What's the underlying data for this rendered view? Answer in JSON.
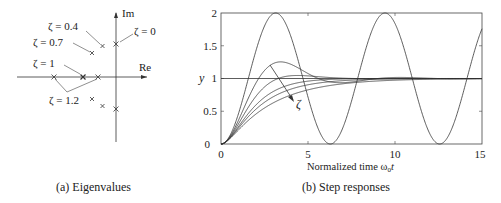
{
  "chart_data": [
    {
      "type": "scatter",
      "title": "Eigenvalues",
      "caption": "(a) Eigenvalues",
      "xlabel": "Re",
      "ylabel": "Im",
      "grid": false,
      "points": [
        {
          "zeta": 0,
          "re": 0.0,
          "im": 1.0
        },
        {
          "zeta": 0,
          "re": 0.0,
          "im": -1.0
        },
        {
          "zeta": 0.4,
          "re": -0.4,
          "im": 0.92
        },
        {
          "zeta": 0.4,
          "re": -0.4,
          "im": -0.92
        },
        {
          "zeta": 0.7,
          "re": -0.7,
          "im": 0.71
        },
        {
          "zeta": 0.7,
          "re": -0.7,
          "im": -0.71
        },
        {
          "zeta": 1,
          "re": -1.0,
          "im": 0.0
        },
        {
          "zeta": 1.2,
          "re": -1.86,
          "im": 0.0
        },
        {
          "zeta": 1.2,
          "re": -0.54,
          "im": 0.0
        }
      ],
      "annotations": [
        "ζ = 0.4",
        "ζ = 0.7",
        "ζ = 0",
        "ζ = 1",
        "ζ = 1.2"
      ]
    },
    {
      "type": "line",
      "title": "Step responses",
      "caption": "(b) Step responses",
      "xlabel": "Normalized time ω0t",
      "ylabel": "y",
      "xlim": [
        0,
        15
      ],
      "ylim": [
        0,
        2
      ],
      "xticks": [
        0,
        5,
        10,
        15
      ],
      "yticks": [
        0,
        0.5,
        1,
        1.5,
        2
      ],
      "grid": false,
      "reference_line": 1,
      "annotation": "ζ (arrow indicates increasing damping)",
      "series": [
        {
          "name": "ζ = 0",
          "zeta": 0
        },
        {
          "name": "ζ = 0.4",
          "zeta": 0.4
        },
        {
          "name": "ζ = 0.7",
          "zeta": 0.7
        },
        {
          "name": "ζ = 1",
          "zeta": 1
        },
        {
          "name": "ζ = 1.2",
          "zeta": 1.2
        },
        {
          "name": "ζ = 1.5",
          "zeta": 1.5
        }
      ]
    }
  ],
  "labels": {
    "im": "Im",
    "re": "Re",
    "z04": "ζ = 0.4",
    "z07": "ζ = 0.7",
    "z0": "ζ = 0",
    "z1": "ζ = 1",
    "z12": "ζ = 1.2",
    "y": "y",
    "zeta": "ζ",
    "xlabel": "Normalized time ω",
    "xlabel_sub": "0",
    "xlabel_t": "t",
    "ytick0": "0",
    "ytick05": "0.5",
    "ytick1": "1",
    "ytick15": "1.5",
    "ytick2": "2",
    "xtick0": "0",
    "xtick5": "5",
    "xtick10": "10",
    "xtick15": "15",
    "cap_a": "(a) Eigenvalues",
    "cap_b": "(b) Step responses"
  }
}
